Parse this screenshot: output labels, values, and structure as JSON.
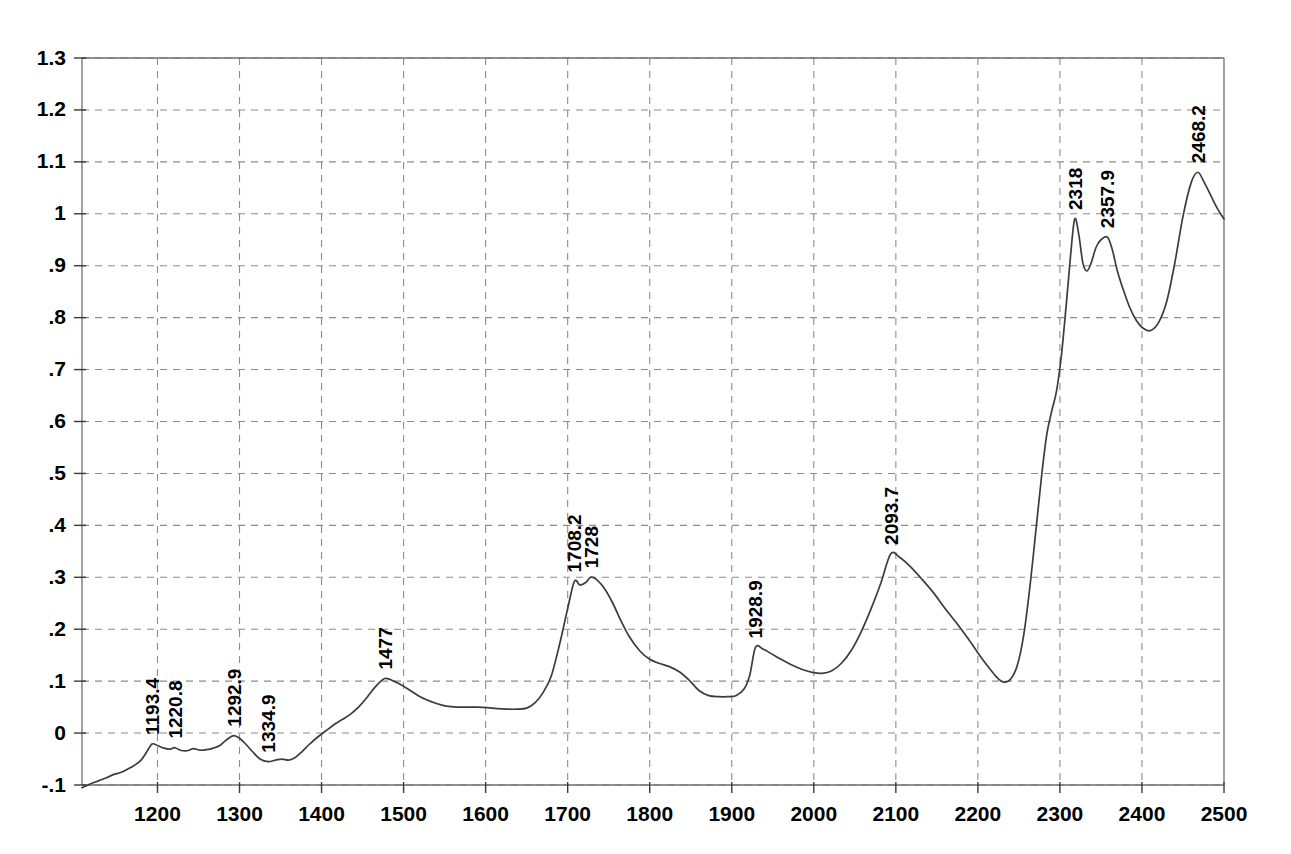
{
  "chart_data": {
    "type": "line",
    "title": "",
    "subtitle": "",
    "xlabel": "",
    "ylabel": "",
    "xlim": [
      1108,
      2500
    ],
    "ylim": [
      -0.1,
      1.3
    ],
    "grid": true,
    "legend": false,
    "legend_position": "none",
    "line_color": "#3c3c3c",
    "grid_color": "#8c8c8c",
    "axis_color": "#6e6e6e",
    "x_ticks": [
      1200,
      1300,
      1400,
      1500,
      1600,
      1700,
      1800,
      1900,
      2000,
      2100,
      2200,
      2300,
      2400,
      2500
    ],
    "x_tick_labels": [
      "1200",
      "1300",
      "1400",
      "1500",
      "1600",
      "1700",
      "1800",
      "1900",
      "2000",
      "2100",
      "2200",
      "2300",
      "2400",
      "2500"
    ],
    "y_ticks": [
      -0.1,
      0,
      0.1,
      0.2,
      0.3,
      0.4,
      0.5,
      0.6,
      0.7,
      0.8,
      0.9,
      1.0,
      1.1,
      1.2,
      1.3
    ],
    "y_tick_labels": [
      "-.1",
      "0",
      ".1",
      ".2",
      ".3",
      ".4",
      ".5",
      ".6",
      ".7",
      ".8",
      ".9",
      "1",
      "1.1",
      "1.2",
      "1.3"
    ],
    "annotations": [
      {
        "label": "1193.4",
        "x": 1193.4,
        "y": -0.021
      },
      {
        "label": "1220.8",
        "x": 1220.8,
        "y": -0.028
      },
      {
        "label": "1292.9",
        "x": 1292.9,
        "y": -0.005
      },
      {
        "label": "1334.9",
        "x": 1334.9,
        "y": -0.055
      },
      {
        "label": "1477",
        "x": 1477.0,
        "y": 0.105
      },
      {
        "label": "1708.2",
        "x": 1708.2,
        "y": 0.292
      },
      {
        "label": "1728",
        "x": 1728.0,
        "y": 0.3
      },
      {
        "label": "1928.9",
        "x": 1928.9,
        "y": 0.165
      },
      {
        "label": "2093.7",
        "x": 2093.7,
        "y": 0.345
      },
      {
        "label": "2318",
        "x": 2318.0,
        "y": 0.99
      },
      {
        "label": "2357.9",
        "x": 2357.9,
        "y": 0.955
      },
      {
        "label": "2468.2",
        "x": 2468.2,
        "y": 1.08
      }
    ],
    "x": [
      1108,
      1118,
      1128,
      1138,
      1146,
      1155,
      1163,
      1172,
      1180,
      1187,
      1193.4,
      1200,
      1208,
      1215,
      1220.8,
      1228,
      1236,
      1244,
      1252,
      1260,
      1268,
      1276,
      1285,
      1292.9,
      1300,
      1308,
      1316,
      1325,
      1334.9,
      1344,
      1352,
      1360,
      1368,
      1376,
      1385,
      1395,
      1405,
      1415,
      1425,
      1435,
      1445,
      1455,
      1465,
      1477,
      1488,
      1498,
      1508,
      1518,
      1528,
      1540,
      1552,
      1565,
      1578,
      1590,
      1602,
      1614,
      1626,
      1638,
      1650,
      1660,
      1670,
      1680,
      1690,
      1700,
      1708.2,
      1715,
      1722,
      1728,
      1735,
      1745,
      1755,
      1765,
      1775,
      1788,
      1800,
      1812,
      1824,
      1836,
      1848,
      1860,
      1872,
      1884,
      1895,
      1905,
      1915,
      1922,
      1928.9,
      1938,
      1948,
      1960,
      1972,
      1985,
      1998,
      2010,
      2022,
      2034,
      2046,
      2058,
      2070,
      2082,
      2093.7,
      2105,
      2118,
      2132,
      2146,
      2160,
      2174,
      2188,
      2202,
      2214,
      2224,
      2232,
      2240,
      2248,
      2256,
      2264,
      2272,
      2278,
      2284,
      2290,
      2296,
      2302,
      2308,
      2313,
      2318,
      2323,
      2328,
      2333,
      2338,
      2344,
      2350,
      2357.9,
      2364,
      2370,
      2377,
      2385,
      2393,
      2401,
      2410,
      2420,
      2430,
      2440,
      2450,
      2460,
      2468.2,
      2476,
      2484,
      2492,
      2500
    ],
    "y": [
      -0.105,
      -0.098,
      -0.092,
      -0.086,
      -0.08,
      -0.076,
      -0.07,
      -0.062,
      -0.052,
      -0.036,
      -0.021,
      -0.024,
      -0.029,
      -0.031,
      -0.028,
      -0.033,
      -0.034,
      -0.03,
      -0.033,
      -0.032,
      -0.029,
      -0.024,
      -0.012,
      -0.005,
      -0.01,
      -0.022,
      -0.036,
      -0.05,
      -0.055,
      -0.052,
      -0.05,
      -0.052,
      -0.047,
      -0.036,
      -0.022,
      -0.008,
      0.004,
      0.016,
      0.026,
      0.036,
      0.05,
      0.068,
      0.088,
      0.105,
      0.1,
      0.092,
      0.082,
      0.072,
      0.064,
      0.057,
      0.052,
      0.05,
      0.05,
      0.05,
      0.049,
      0.047,
      0.046,
      0.046,
      0.048,
      0.058,
      0.078,
      0.11,
      0.17,
      0.24,
      0.292,
      0.285,
      0.29,
      0.3,
      0.296,
      0.278,
      0.25,
      0.216,
      0.186,
      0.158,
      0.142,
      0.134,
      0.128,
      0.118,
      0.102,
      0.082,
      0.072,
      0.07,
      0.07,
      0.072,
      0.085,
      0.112,
      0.165,
      0.162,
      0.153,
      0.142,
      0.132,
      0.123,
      0.117,
      0.115,
      0.12,
      0.135,
      0.16,
      0.196,
      0.24,
      0.29,
      0.345,
      0.338,
      0.32,
      0.296,
      0.27,
      0.24,
      0.212,
      0.182,
      0.15,
      0.125,
      0.106,
      0.098,
      0.104,
      0.13,
      0.19,
      0.29,
      0.41,
      0.5,
      0.575,
      0.62,
      0.66,
      0.73,
      0.83,
      0.92,
      0.99,
      0.96,
      0.905,
      0.89,
      0.905,
      0.935,
      0.95,
      0.955,
      0.93,
      0.89,
      0.855,
      0.82,
      0.795,
      0.78,
      0.775,
      0.79,
      0.83,
      0.905,
      0.995,
      1.06,
      1.08,
      1.06,
      1.035,
      1.01,
      0.99
    ]
  }
}
